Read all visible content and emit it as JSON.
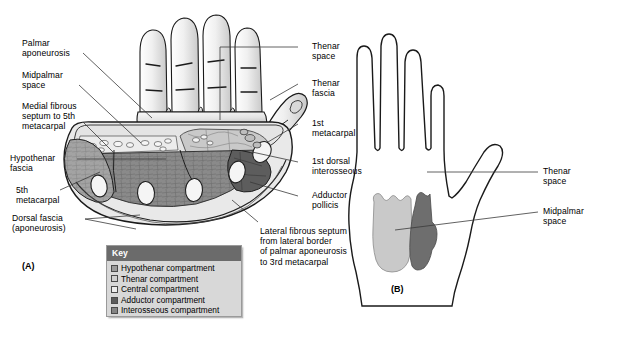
{
  "figure": {
    "panels": [
      {
        "id": "A",
        "label": "(A)"
      },
      {
        "id": "B",
        "label": "(B)"
      }
    ]
  },
  "panel_a": {
    "labels_left": [
      {
        "name": "palmar-aponeurosis",
        "text": "Palmar\naponeurosis"
      },
      {
        "name": "midpalmar-space",
        "text": "Midpalmar\nspace"
      },
      {
        "name": "medial-fibrous-septum",
        "text": "Medial fibrous\nseptum to 5th\nmetacarpal"
      },
      {
        "name": "hypothenar-fascia",
        "text": "Hypothenar\nfascia"
      },
      {
        "name": "fifth-metacarpal",
        "text": "5th\nmetacarpal"
      },
      {
        "name": "dorsal-fascia",
        "text": "Dorsal fascia\n(aponeurosis)"
      }
    ],
    "labels_right": [
      {
        "name": "thenar-space",
        "text": "Thenar\nspace"
      },
      {
        "name": "thenar-fascia",
        "text": "Thenar\nfascia"
      },
      {
        "name": "first-metacarpal",
        "text": "1st\nmetacarpal"
      },
      {
        "name": "first-dorsal-interosseous",
        "text": "1st dorsal\ninterosseous"
      },
      {
        "name": "adductor-pollicis",
        "text": "Adductor\npollicis"
      }
    ],
    "labels_bottom": [
      {
        "name": "lateral-fibrous-septum",
        "text": "Lateral fibrous septum\nfrom lateral border\nof palmar aponeurosis\nto 3rd metacarpal"
      }
    ]
  },
  "panel_b": {
    "labels_right": [
      {
        "name": "thenar-space",
        "text": "Thenar\nspace"
      },
      {
        "name": "midpalmar-space",
        "text": "Midpalmar\nspace"
      }
    ]
  },
  "key": {
    "title": "Key",
    "items": [
      {
        "name": "hypothenar-compartment",
        "label": "Hypothenar compartment",
        "color": "#9b9b9b"
      },
      {
        "name": "thenar-compartment",
        "label": "Thenar compartment",
        "color": "#cfcfcf"
      },
      {
        "name": "central-compartment",
        "label": "Central compartment",
        "color": "#ececec"
      },
      {
        "name": "adductor-compartment",
        "label": "Adductor compartment",
        "color": "#5b5b5b"
      },
      {
        "name": "interosseous-compartment",
        "label": "Interosseous compartment",
        "color": "#848484"
      }
    ]
  },
  "colors": {
    "outline": "#1a1a1a",
    "leader": "#3a3a3a",
    "skin_light": "#f2f2f2",
    "skin_shade": "#d0d0d0",
    "fascia": "#c7c7c7",
    "central": "#e6e6e6",
    "hypothenar": "#9b9b9b",
    "thenar": "#cfcfcf",
    "adductor": "#5b5b5b",
    "interosseous": "#8a8a8a",
    "bone": "#f4f4f4",
    "panel_b_light": "#c9c9c9",
    "panel_b_dark": "#6e6e6e",
    "key_header": "#6b6b6b",
    "key_bg": "#d8d8d8"
  }
}
